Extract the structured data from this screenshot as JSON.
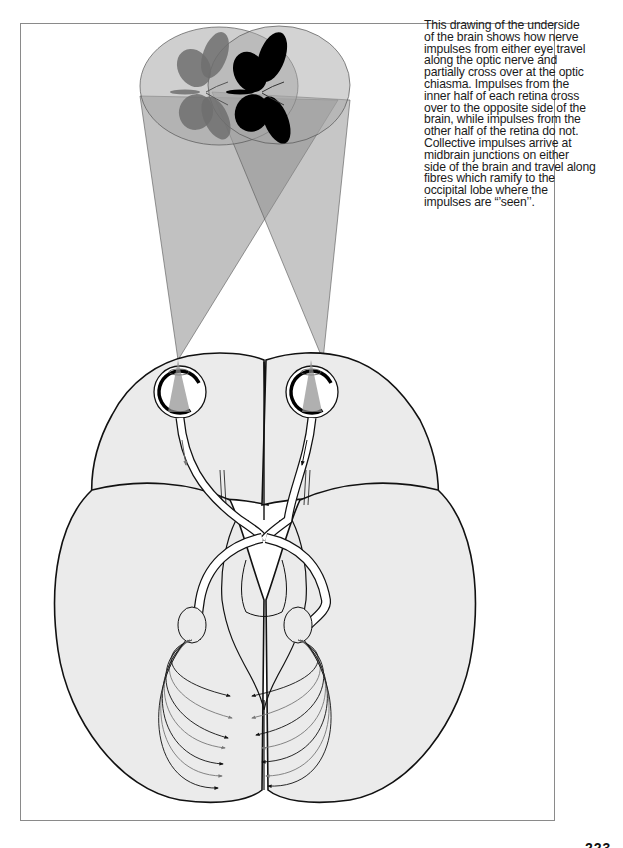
{
  "page": {
    "caption_lines": [
      "This drawing of the underside",
      "of the brain shows how nerve",
      "impulses from either eye travel",
      "along the optic nerve and",
      "partially cross over at the optic",
      "chiasma. Impulses from the",
      "inner half of each retina cross",
      "over to the opposite side of the",
      "brain, while impulses from the",
      "other half of the retina do not.",
      "Collective impulses arrive at",
      "midbrain junctions on either",
      "side of the brain and travel along",
      "fibres which ramify to the",
      "occipital lobe where the",
      "impulses are “’seen’’."
    ],
    "page_number": "223"
  },
  "diagram": {
    "elements": [
      "butterfly-image-left-eye-view",
      "butterfly-image-right-eye-view",
      "visual-field-cone-left",
      "visual-field-cone-right",
      "left-eye",
      "right-eye",
      "optic-nerve-left",
      "optic-nerve-right",
      "optic-chiasma",
      "midbrain-junction-left",
      "midbrain-junction-right",
      "optic-radiation-fibres-left",
      "optic-radiation-fibres-right",
      "occipital-lobe"
    ],
    "colors": {
      "brain_fill": "#ebebeb",
      "outline": "#111111",
      "cone_fill": "#9a9a9a",
      "butterfly_dark": "#000000",
      "butterfly_grey": "#6e6e6e",
      "frame": "#8a8a8a"
    }
  }
}
